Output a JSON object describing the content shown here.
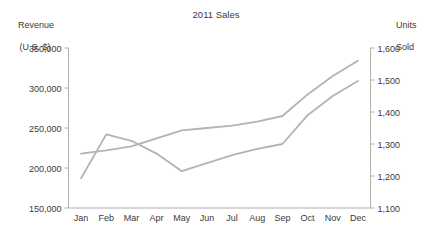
{
  "chart_data": {
    "type": "line",
    "title": "2011 Sales",
    "xlabel": "",
    "categories": [
      "Jan",
      "Feb",
      "Mar",
      "Apr",
      "May",
      "Jun",
      "Jul",
      "Aug",
      "Sep",
      "Oct",
      "Nov",
      "Dec"
    ],
    "grid": false,
    "legend": "none",
    "axes": {
      "left": {
        "label_line1": "Revenue",
        "label_line2": "(U.S. $)",
        "ticks": [
          "150,000",
          "200,000",
          "250,000",
          "300,000",
          "350,000"
        ],
        "tick_values": [
          150000,
          200000,
          250000,
          300000,
          350000
        ],
        "min": 150000,
        "max": 350000
      },
      "right": {
        "label_line1": "Units",
        "label_line2": "Sold",
        "ticks": [
          "1,100",
          "1,200",
          "1,300",
          "1,400",
          "1,500",
          "1,600"
        ],
        "tick_values": [
          1100,
          1200,
          1300,
          1400,
          1500,
          1600
        ],
        "min": 1100,
        "max": 1600
      }
    },
    "series": [
      {
        "name": "Revenue (U.S. $)",
        "axis": "left",
        "color": "#b3b3b3",
        "values": [
          218000,
          222000,
          227000,
          237000,
          247000,
          250000,
          253000,
          258000,
          265000,
          292000,
          315000,
          334000
        ]
      },
      {
        "name": "Units Sold",
        "axis": "right",
        "color": "#b3b3b3",
        "values": [
          1193,
          1330,
          1310,
          1270,
          1215,
          1240,
          1265,
          1285,
          1300,
          1390,
          1450,
          1497
        ]
      }
    ]
  },
  "colors": {
    "series": "#b3b3b3",
    "axis": "#b0b0b0",
    "text": "#3a3a3a",
    "background": "#ffffff"
  }
}
